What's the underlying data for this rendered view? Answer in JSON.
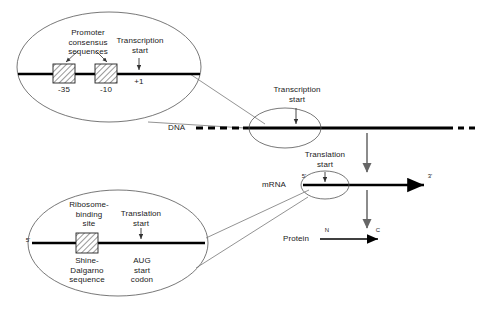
{
  "diagram": {
    "colors": {
      "dna_line": "#000000",
      "mrna_line": "#000000",
      "protein_line": "#000000",
      "callout_outline": "#555555",
      "leader_line": "#777777",
      "flow_arrow": "#666666",
      "box_fill": "#ffffff",
      "hatch": "#333333",
      "text": "#1a1a1a",
      "background": "#ffffff"
    },
    "promoter_callout": {
      "name": "promoter-consensus-callout",
      "label_consensus": "Promoter\nconsensus\nsequences",
      "label_transcription_start": "Transcription\nstart",
      "box_minus35": "-35",
      "box_minus10": "-10",
      "position_plus1": "+1"
    },
    "dna_track": {
      "name": "dna-strand",
      "label": "DNA",
      "transcription_start_label": "Transcription\nstart"
    },
    "mrna_track": {
      "name": "mrna-strand",
      "label": "mRNA",
      "five_prime": "5'",
      "three_prime": "3'",
      "translation_start_label": "Translation\nstart"
    },
    "protein_track": {
      "name": "protein-chain",
      "label": "Protein",
      "n_terminus": "N",
      "c_terminus": "C"
    },
    "rbs_callout": {
      "name": "ribosome-binding-site-callout",
      "label_rbs": "Ribosome-\nbinding\nsite",
      "label_translation_start": "Translation\nstart",
      "label_shine_dalgarno": "Shine-\nDalgarno\nsequence",
      "label_aug": "AUG\nstart\ncodon",
      "five_prime": "5'"
    }
  }
}
